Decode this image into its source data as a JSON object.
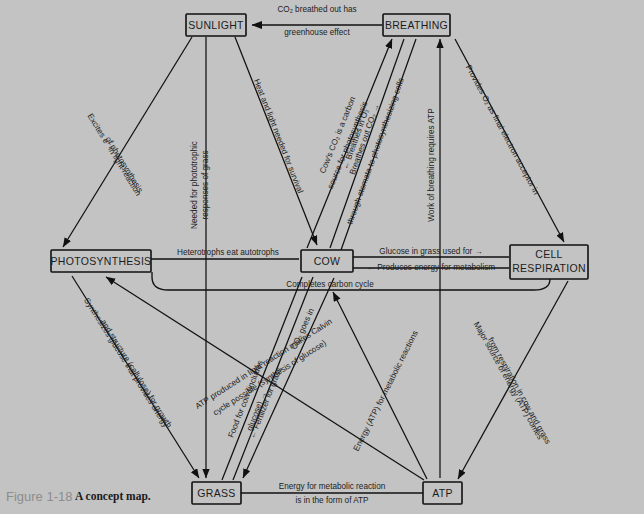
{
  "figure": {
    "number": "Figure 1-18",
    "caption": "A concept map."
  },
  "colors": {
    "background": "#c3c3c3",
    "ink": "#111111",
    "caption_number": "#8d8d8d"
  },
  "nodes": [
    {
      "id": "sunlight",
      "label": "SUNLIGHT"
    },
    {
      "id": "breathing",
      "label": "BREATHING"
    },
    {
      "id": "photosynthesis",
      "label": "PHOTOSYNTHESIS"
    },
    {
      "id": "cow",
      "label": "COW"
    },
    {
      "id": "cell_respiration",
      "label": "CELL RESPIRATION"
    },
    {
      "id": "cell_respiration_line1",
      "label": "CELL"
    },
    {
      "id": "cell_respiration_line2",
      "label": "RESPIRATION"
    },
    {
      "id": "grass",
      "label": "GRASS"
    },
    {
      "id": "atp",
      "label": "ATP"
    }
  ],
  "edges": [
    {
      "id": "e1",
      "from": "breathing",
      "to": "sunlight",
      "label_line1": "CO₂ breathed out has",
      "label_line2": "greenhouse effect"
    },
    {
      "id": "e2",
      "from": "sunlight",
      "to": "photosynthesis",
      "label_line1": "Excites e⁻ in light reaction",
      "label_line2": "of photosynthesis"
    },
    {
      "id": "e3",
      "from": "sunlight",
      "to": "grass",
      "label_line1": "Needed for phototrophic",
      "label_line2": "responses of grass"
    },
    {
      "id": "e4",
      "from": "sunlight",
      "to": "cow",
      "label_line1": "Heat and light needed for survival"
    },
    {
      "id": "e5",
      "from": "cow",
      "to": "breathing",
      "label_line1": "Cow's CO₂ is a carbon",
      "label_line2": "source for photosynthesis"
    },
    {
      "id": "e6",
      "from": "breathing",
      "to": "cow",
      "label_line1": "← Breathes in O₂"
    },
    {
      "id": "e7",
      "from": "cow",
      "to": "breathing",
      "label_line1": "Breathes out CO₂ →",
      "label_line2": "through stomata to photosynthesizing cells"
    },
    {
      "id": "e8",
      "from": "atp",
      "to": "breathing",
      "label_line1": "Work of breathing requires ATP"
    },
    {
      "id": "e9",
      "from": "breathing",
      "to": "cell_respiration",
      "label_line1": "Provides O₂ as final electron acceptor in"
    },
    {
      "id": "e10",
      "from": "photosynthesis",
      "to": "cow",
      "label_line1": "Heterotrophs eat autotrophs"
    },
    {
      "id": "e11",
      "from": "cow",
      "to": "cell_respiration",
      "label_line1": "Glucose in grass used for →"
    },
    {
      "id": "e12",
      "from": "cell_respiration",
      "to": "cow",
      "label_line1": "← Produces energy for metabolism"
    },
    {
      "id": "e13",
      "from": "cell_respiration",
      "to": "photosynthesis",
      "label_line1": "Completes carbon cycle"
    },
    {
      "id": "e14",
      "from": "photosynthesis",
      "to": "grass",
      "label_line1": "Synthesizes glucose that provides energy",
      "label_line2": "and structure (cellulose) for growth"
    },
    {
      "id": "e15",
      "from": "atp",
      "to": "photosynthesis",
      "label_line1": "ATP produced in light reaction makes Calvin",
      "label_line2": "cycle possible (synthesis of glucose)"
    },
    {
      "id": "e16",
      "from": "grass",
      "to": "cow",
      "label_line1": "Food for cow (includes",
      "label_line2": "glucose) →"
    },
    {
      "id": "e17",
      "from": "cow",
      "to": "grass",
      "label_line1": "← Fertilizer for grass"
    },
    {
      "id": "e18",
      "from": "cow",
      "to": "grass",
      "label_line1": "CO₂ goes in"
    },
    {
      "id": "e19",
      "from": "atp",
      "to": "cow",
      "label_line1": "Energy (ATP) for metabolic reactions"
    },
    {
      "id": "e20",
      "from": "cell_respiration",
      "to": "atp",
      "label_line1": "Major source of energy (ATP) comes",
      "label_line2": "from respiration in cow and grass"
    },
    {
      "id": "e21",
      "from": "grass",
      "to": "atp",
      "label_line1": "Energy for metabolic reaction",
      "label_line2": "is in the form of ATP"
    }
  ]
}
